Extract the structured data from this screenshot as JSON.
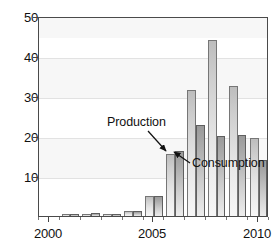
{
  "chart_data": {
    "type": "bar",
    "title": "",
    "subtitle": "",
    "xlabel": "",
    "ylabel": "",
    "xlim": [
      1999.5,
      2010.5
    ],
    "ylim": [
      0,
      50
    ],
    "yticks": [
      10,
      20,
      30,
      40,
      50
    ],
    "xticks": [
      2000,
      2005,
      2010
    ],
    "xtick_labels": [
      "2000",
      "2005",
      "2010"
    ],
    "ytick_labels": [
      "10",
      "20",
      "30",
      "40",
      "50"
    ],
    "grid": "horizontal-faint-bands",
    "legend": "annotated-arrows",
    "categories": [
      2000,
      2001,
      2002,
      2003,
      2004,
      2005,
      2006,
      2007,
      2008,
      2009,
      2010
    ],
    "category_labels": [
      "2000",
      "2001",
      "2002",
      "2003",
      "2004",
      "2005",
      "2006",
      "2007",
      "2008",
      "2009",
      "2010"
    ],
    "series": [
      {
        "name": "Production",
        "color": "#d2d2d2",
        "values": [
          0,
          0.5,
          0.6,
          0.6,
          1.3,
          5.0,
          15.6,
          31.6,
          44.0,
          32.6,
          19.5
        ]
      },
      {
        "name": "Consumption",
        "color": "#a8a8a8",
        "values": [
          0,
          0.4,
          0.8,
          0.5,
          1.3,
          5.0,
          16.3,
          22.8,
          20.0,
          20.2,
          14.0
        ]
      }
    ],
    "annotations": [
      {
        "id": "production",
        "text": "Production",
        "label_x": 107,
        "label_y": 116,
        "arrow_from_x": 148,
        "arrow_from_y": 131,
        "arrow_to_x": 166,
        "arrow_to_y": 151
      },
      {
        "id": "consumption",
        "text": "Consumption",
        "label_x": 192,
        "label_y": 157,
        "arrow_from_x": 190,
        "arrow_from_y": 163,
        "arrow_to_x": 174,
        "arrow_to_y": 152
      }
    ]
  },
  "axis": {
    "y_labels": [
      "50",
      "40",
      "30",
      "20",
      "10"
    ],
    "x_labels": [
      "2000",
      "2005",
      "2010"
    ]
  }
}
